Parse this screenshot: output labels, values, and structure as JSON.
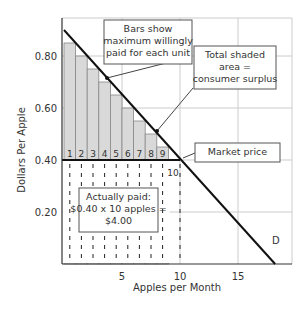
{
  "chart_data": {
    "type": "bar",
    "title": "",
    "xlabel": "Apples per Month",
    "ylabel": "Dollars Per Apple",
    "xlim": [
      0,
      19.5
    ],
    "ylim": [
      0,
      0.95
    ],
    "x_ticks": [
      "5",
      "10",
      "15"
    ],
    "y_ticks": [
      "0.20",
      "0.40",
      "0.60",
      "0.80"
    ],
    "grid": true,
    "categories": [
      "1",
      "2",
      "3",
      "4",
      "5",
      "6",
      "7",
      "8",
      "9"
    ],
    "values": [
      0.85,
      0.8,
      0.75,
      0.7,
      0.65,
      0.6,
      0.55,
      0.5,
      0.45
    ],
    "bar_labels": [
      "1",
      "2",
      "3",
      "4",
      "5",
      "6",
      "7",
      "8",
      "9"
    ],
    "market_price": 0.4,
    "demand_line": {
      "label": "D",
      "x": [
        0,
        18.2
      ],
      "y": [
        0.9,
        0.0
      ]
    },
    "paid_units_label": "10",
    "annotations": {
      "bars_note": [
        "Bars show",
        "maximum willingly",
        "paid for each unit"
      ],
      "surplus_note": [
        "Total shaded",
        "area =",
        "consumer surplus"
      ],
      "market_price_note": "Market price",
      "paid_note": [
        "Actually paid:",
        "$0.40 x 10 apples =",
        "$4.00"
      ]
    },
    "colors": {
      "bar_fill": "#d9d9d9",
      "bar_edge": "#888888",
      "line": "#111111",
      "grid": "#cccccc"
    }
  }
}
